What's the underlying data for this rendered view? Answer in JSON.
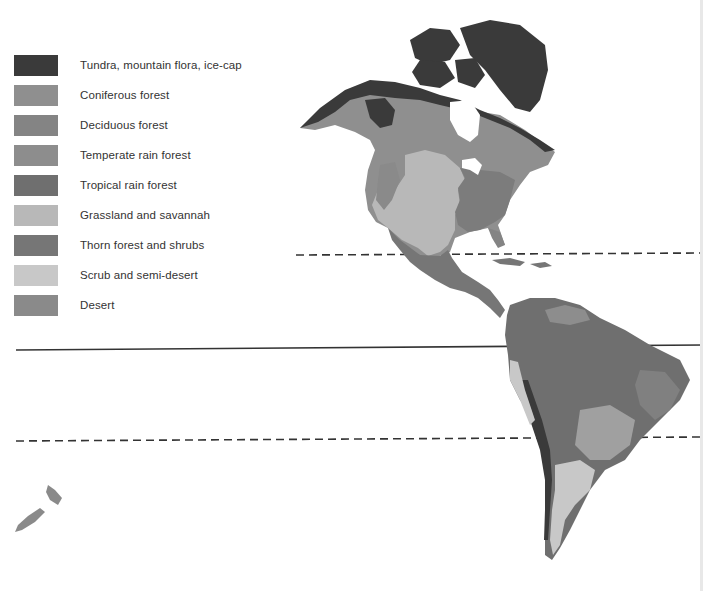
{
  "legend": {
    "items": [
      {
        "label": "Tundra, mountain flora, ice-cap",
        "color": "#3a3a3a"
      },
      {
        "label": "Coniferous forest",
        "color": "#8f8f8f"
      },
      {
        "label": "Deciduous forest",
        "color": "#848484"
      },
      {
        "label": "Temperate rain forest",
        "color": "#8d8d8d"
      },
      {
        "label": "Tropical rain forest",
        "color": "#6f6f6f"
      },
      {
        "label": "Grassland and savannah",
        "color": "#b8b8b8"
      },
      {
        "label": "Thorn forest and shrubs",
        "color": "#767676"
      },
      {
        "label": "Scrub and semi-desert",
        "color": "#c8c8c8"
      },
      {
        "label": "Desert",
        "color": "#8a8a8a"
      }
    ]
  },
  "map": {
    "lines": [
      {
        "name": "tropic-of-cancer",
        "style": "dashed",
        "y": 255
      },
      {
        "name": "equator",
        "style": "solid",
        "y": 348
      },
      {
        "name": "tropic-of-capricorn",
        "style": "dashed",
        "y": 440
      }
    ]
  }
}
